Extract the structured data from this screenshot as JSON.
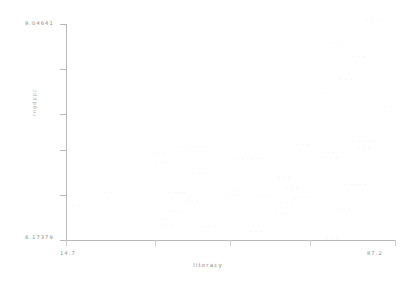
{
  "chart_data": {
    "type": "scatter",
    "title": "",
    "xlabel": "literacy",
    "ylabel": "lngdppc",
    "xlim": [
      14.7,
      87.2
    ],
    "ylim": [
      6.17379,
      9.04641
    ],
    "xtick_labels": [
      "14.7",
      "87.2"
    ],
    "ytick_labels": [
      "9.04641",
      "6.17379"
    ],
    "grid": false,
    "legend": null,
    "marker_style": "country-code-text",
    "x": [
      16.1,
      24.0,
      26.4,
      29.9,
      32.6,
      34.1,
      35.0,
      35.8,
      37.2,
      38.4,
      40.1,
      41.5,
      43.0,
      44.6,
      46.2,
      47.0,
      48.8,
      50.3,
      52.0,
      53.4,
      54.9,
      56.1,
      57.4,
      58.8,
      60.3,
      61.7,
      63.2,
      64.8,
      66.1,
      67.5,
      69.0,
      70.4,
      71.9,
      73.3,
      74.8,
      76.2,
      77.6,
      79.1,
      80.5,
      82.0,
      83.4,
      84.9,
      86.0,
      86.8
    ],
    "y": [
      6.6,
      6.82,
      6.52,
      6.38,
      6.45,
      6.3,
      6.7,
      7.18,
      7.02,
      6.9,
      7.32,
      7.4,
      6.62,
      7.1,
      6.95,
      7.28,
      7.48,
      7.35,
      6.8,
      7.22,
      7.05,
      6.55,
      7.3,
      7.15,
      6.88,
      7.26,
      7.42,
      6.98,
      7.55,
      7.12,
      6.42,
      7.62,
      7.2,
      7.75,
      7.05,
      7.45,
      7.88,
      8.35,
      7.6,
      8.62,
      8.48,
      7.92,
      8.98,
      8.05
    ],
    "points": [
      {
        "x": 16.1,
        "y": 6.6,
        "px": 72,
        "py": 197
      },
      {
        "x": 24.0,
        "y": 6.82,
        "px": 104,
        "py": 188
      },
      {
        "x": 37.2,
        "y": 7.02,
        "px": 156,
        "py": 200
      },
      {
        "x": 38.4,
        "y": 6.9,
        "px": 163,
        "py": 180
      },
      {
        "x": 32.6,
        "y": 6.45,
        "px": 158,
        "py": 210
      },
      {
        "x": 34.1,
        "y": 6.3,
        "px": 160,
        "py": 219
      },
      {
        "x": 35.0,
        "y": 6.7,
        "px": 164,
        "py": 224
      },
      {
        "x": 40.1,
        "y": 7.32,
        "px": 155,
        "py": 153
      },
      {
        "x": 41.5,
        "y": 7.4,
        "px": 158,
        "py": 162
      },
      {
        "x": 43.0,
        "y": 6.62,
        "px": 172,
        "py": 190
      },
      {
        "x": 44.6,
        "y": 7.1,
        "px": 182,
        "py": 147
      },
      {
        "x": 46.2,
        "y": 6.95,
        "px": 196,
        "py": 174
      },
      {
        "x": 47.0,
        "y": 7.28,
        "px": 214,
        "py": 231
      },
      {
        "x": 48.8,
        "y": 7.48,
        "px": 238,
        "py": 196
      },
      {
        "x": 50.3,
        "y": 7.35,
        "px": 248,
        "py": 160
      },
      {
        "x": 52.0,
        "y": 6.8,
        "px": 264,
        "py": 235
      },
      {
        "x": 53.4,
        "y": 7.22,
        "px": 270,
        "py": 196
      },
      {
        "x": 54.9,
        "y": 7.05,
        "px": 276,
        "py": 203
      },
      {
        "x": 56.1,
        "y": 6.55,
        "px": 290,
        "py": 215
      },
      {
        "x": 57.4,
        "y": 7.3,
        "px": 294,
        "py": 178
      },
      {
        "x": 58.8,
        "y": 7.15,
        "px": 296,
        "py": 205
      },
      {
        "x": 60.3,
        "y": 6.88,
        "px": 300,
        "py": 218
      },
      {
        "x": 61.7,
        "y": 7.26,
        "px": 314,
        "py": 157
      },
      {
        "x": 63.2,
        "y": 7.42,
        "px": 316,
        "py": 143
      },
      {
        "x": 64.8,
        "y": 6.98,
        "px": 334,
        "py": 240
      },
      {
        "x": 66.1,
        "y": 7.55,
        "px": 338,
        "py": 198
      },
      {
        "x": 67.5,
        "y": 7.12,
        "px": 340,
        "py": 211
      },
      {
        "x": 69.0,
        "y": 6.42,
        "px": 344,
        "py": 155
      },
      {
        "x": 70.4,
        "y": 7.62,
        "px": 352,
        "py": 128
      },
      {
        "x": 71.9,
        "y": 7.2,
        "px": 356,
        "py": 183
      },
      {
        "x": 73.3,
        "y": 7.75,
        "px": 358,
        "py": 96
      },
      {
        "x": 74.8,
        "y": 7.05,
        "px": 360,
        "py": 140
      },
      {
        "x": 76.2,
        "y": 7.45,
        "px": 366,
        "py": 57
      },
      {
        "x": 77.6,
        "y": 7.88,
        "px": 370,
        "py": 80
      },
      {
        "x": 79.1,
        "y": 8.35,
        "px": 374,
        "py": 146
      },
      {
        "x": 80.5,
        "y": 7.6,
        "px": 378,
        "py": 184
      },
      {
        "x": 82.0,
        "y": 8.62,
        "px": 380,
        "py": 45
      },
      {
        "x": 83.4,
        "y": 8.48,
        "px": 384,
        "py": 22
      },
      {
        "x": 84.9,
        "y": 7.92,
        "px": 388,
        "py": 109
      },
      {
        "x": 86.0,
        "y": 8.98,
        "px": 330,
        "py": 122
      },
      {
        "x": 86.8,
        "y": 8.05,
        "px": 308,
        "py": 151
      }
    ]
  },
  "axes": {
    "y_max_label": "9.04641",
    "y_min_label": "6.17379",
    "x_min_label": "14.7",
    "x_max_label": "87.2",
    "x_title": "literacy",
    "y_title": "lngdppc"
  },
  "colors": {
    "axis": "#b9b9b9",
    "text": "#8d8d8d",
    "marker": "#c9c9c9",
    "background": "#ffffff"
  },
  "markers": [
    {
      "glyph": "· · ·",
      "left": 68,
      "top": 203
    },
    {
      "glyph": "· ·",
      "left": 104,
      "top": 190
    },
    {
      "glyph": "· · ·",
      "left": 152,
      "top": 151
    },
    {
      "glyph": "· · ·",
      "left": 155,
      "top": 160
    },
    {
      "glyph": "· · · · · ·",
      "left": 178,
      "top": 144
    },
    {
      "glyph": "· · ·",
      "left": 192,
      "top": 171
    },
    {
      "glyph": "· · · ·",
      "left": 168,
      "top": 190
    },
    {
      "glyph": "· · ·",
      "left": 186,
      "top": 199
    },
    {
      "glyph": "· · ·",
      "left": 168,
      "top": 209
    },
    {
      "glyph": "· ·",
      "left": 161,
      "top": 217
    },
    {
      "glyph": "· · ·",
      "left": 160,
      "top": 223
    },
    {
      "glyph": "· · ·",
      "left": 204,
      "top": 224
    },
    {
      "glyph": "· · · · · ·",
      "left": 236,
      "top": 156
    },
    {
      "glyph": "· · ·",
      "left": 228,
      "top": 193
    },
    {
      "glyph": "· · · ·",
      "left": 258,
      "top": 194
    },
    {
      "glyph": "· · ·",
      "left": 281,
      "top": 200
    },
    {
      "glyph": "· · ·",
      "left": 275,
      "top": 211
    },
    {
      "glyph": "· · ·",
      "left": 250,
      "top": 229
    },
    {
      "glyph": "· · ·",
      "left": 278,
      "top": 175
    },
    {
      "glyph": "· · ·",
      "left": 322,
      "top": 150
    },
    {
      "glyph": "· · ·",
      "left": 296,
      "top": 142
    },
    {
      "glyph": "· · ·",
      "left": 326,
      "top": 155
    },
    {
      "glyph": "· · · · ·",
      "left": 352,
      "top": 139
    },
    {
      "glyph": "· · ·",
      "left": 358,
      "top": 146
    },
    {
      "glyph": "· · · · ·",
      "left": 344,
      "top": 182
    },
    {
      "glyph": "· · ·",
      "left": 338,
      "top": 207
    },
    {
      "glyph": "· · ·",
      "left": 326,
      "top": 236
    },
    {
      "glyph": "· ·",
      "left": 325,
      "top": 91
    },
    {
      "glyph": "· · ·",
      "left": 340,
      "top": 77
    },
    {
      "glyph": "· · ·",
      "left": 353,
      "top": 54
    },
    {
      "glyph": "· · ·",
      "left": 330,
      "top": 40
    },
    {
      "glyph": "· · · ·",
      "left": 366,
      "top": 18
    },
    {
      "glyph": "· ·",
      "left": 385,
      "top": 104
    },
    {
      "glyph": "· · ·",
      "left": 286,
      "top": 185
    },
    {
      "glyph": "· · ·",
      "left": 295,
      "top": 195
    },
    {
      "glyph": "· ·",
      "left": 234,
      "top": 188
    }
  ]
}
